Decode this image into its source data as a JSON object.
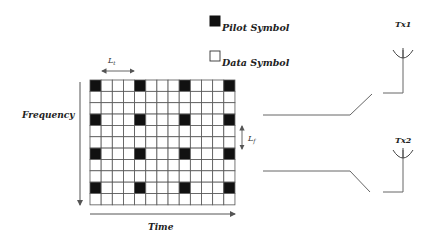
{
  "legend": {
    "pilot_label": "Pilot Symbol",
    "data_label": "Data Symbol"
  },
  "grid": {
    "rows": 11,
    "cols": 13,
    "pilot_rows": [
      0,
      3,
      6,
      9
    ],
    "pilot_cols": [
      0,
      4,
      8,
      12
    ],
    "x": 90,
    "y": 80,
    "cell_w": 11.15,
    "cell_h": 11.35
  },
  "labels": {
    "lt": "L",
    "lt_sub": "t",
    "lf": "L",
    "lf_sub": "f",
    "frequency": "Frequency",
    "time": "Time",
    "tx1": "Tx1",
    "tx2": "Tx2"
  },
  "colors": {
    "pilot": "#111111",
    "grid_line": "#555555",
    "line": "#666666"
  }
}
